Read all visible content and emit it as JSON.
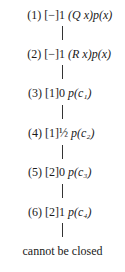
{
  "tableau": {
    "nodes": [
      {
        "label": "(1) [−]",
        "value": "1",
        "formula": "(Q x)p(x)"
      },
      {
        "label": "(2) [−]",
        "value": "1",
        "formula": "(R x)p(x)"
      },
      {
        "label": "(3) [1]",
        "value": "0",
        "formula": "p(c₁)"
      },
      {
        "label": "(4) [1]",
        "value": "½",
        "formula": "p(c₂)"
      },
      {
        "label": "(5) [2]",
        "value": "0",
        "formula": "p(c₃)"
      },
      {
        "label": "(6) [2]",
        "value": "1",
        "formula": "p(c₄)"
      }
    ],
    "conclusion": "cannot be closed"
  }
}
